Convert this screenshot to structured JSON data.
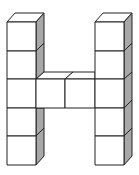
{
  "figure": {
    "letter": "H",
    "left_column_cubes": 5,
    "right_column_cubes": 5,
    "crossbar_cubes": 2,
    "total_cubes": 12,
    "colors": {
      "face": "#ffffff",
      "side_shade": "#a8a8a8",
      "stroke": "#222222",
      "background": "#ffffff"
    }
  }
}
